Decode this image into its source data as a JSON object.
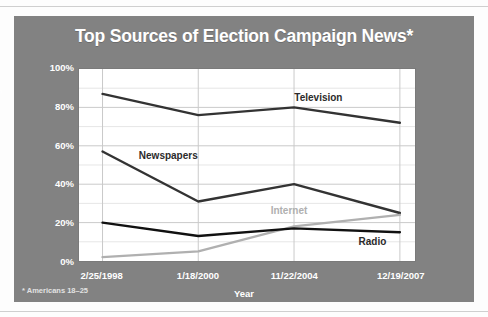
{
  "figure": {
    "title": "Top Sources of Election Campaign News*",
    "footnote": "* Americans 18–25",
    "panel_color": "#828282",
    "plot_bg": "#ffffff",
    "title_color": "#ffffff"
  },
  "chart_data": {
    "type": "line",
    "title": "Top Sources of Election Campaign News*",
    "xlabel": "Year",
    "ylabel": "Percentages",
    "categories": [
      "2/25/1998",
      "1/18/2000",
      "11/22/2004",
      "12/19/2007"
    ],
    "ylim": [
      0,
      100
    ],
    "yticks": [
      "0%",
      "20%",
      "40%",
      "60%",
      "80%",
      "100%"
    ],
    "ytick_values": [
      0,
      20,
      40,
      60,
      80,
      100
    ],
    "minor_gridlines": true,
    "grid": true,
    "legend": "inline-annotations",
    "series": [
      {
        "name": "Television",
        "values": [
          87,
          76,
          80,
          72
        ],
        "color": "#333333",
        "label_x_pct": 64,
        "label_y_pct": 84
      },
      {
        "name": "Newspapers",
        "values": [
          57,
          31,
          40,
          25
        ],
        "color": "#333333",
        "label_x_pct": 18,
        "label_y_pct": 54
      },
      {
        "name": "Internet",
        "values": [
          2,
          5,
          18,
          24
        ],
        "color": "#b0b0b0",
        "label_x_pct": 57,
        "label_y_pct": 26
      },
      {
        "name": "Radio",
        "values": [
          20,
          13,
          17,
          15
        ],
        "color": "#111111",
        "label_x_pct": 83,
        "label_y_pct": 10
      }
    ]
  }
}
